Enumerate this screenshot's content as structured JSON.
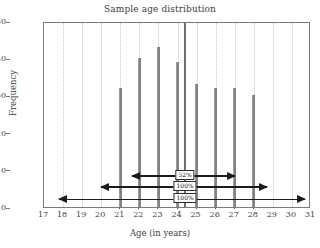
{
  "chart_data": {
    "type": "bar",
    "title": "Sample age distribution",
    "xlabel": "Age (in years)",
    "ylabel": "Frequency",
    "xlim": [
      17,
      31
    ],
    "ylim": [
      0,
      50
    ],
    "grid": true,
    "legend": "none",
    "xticks": [
      17,
      18,
      19,
      20,
      21,
      22,
      23,
      24,
      25,
      26,
      27,
      28,
      29,
      30,
      31
    ],
    "yticks": [
      0,
      10,
      20,
      30,
      40,
      50
    ],
    "categories": [
      21,
      22,
      23,
      24,
      25,
      26,
      27,
      28
    ],
    "values": [
      32,
      40,
      43,
      39,
      33,
      32,
      32,
      30
    ],
    "bar_color": "#838383",
    "annotations": {
      "median_line": {
        "x": 24.4,
        "color": "#6f6f6f"
      },
      "intervals": [
        {
          "label": "52%",
          "x_start": 21.6,
          "x_end": 27.0,
          "y": 9,
          "style": "thick"
        },
        {
          "label": "100%",
          "x_start": 20.0,
          "x_end": 28.7,
          "y": 6,
          "style": "thick"
        },
        {
          "label": "100%",
          "x_start": 17.8,
          "x_end": 30.7,
          "y": 2.8,
          "style": "thin"
        }
      ]
    }
  }
}
